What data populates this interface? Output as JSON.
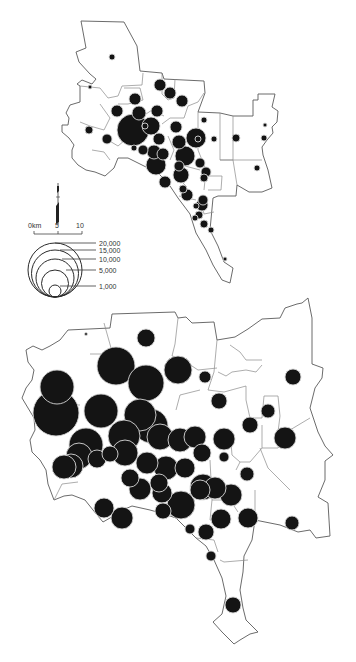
{
  "scale_bar": {
    "labels": [
      "0km",
      "5",
      "10"
    ]
  },
  "legend": {
    "title": "",
    "entries": [
      {
        "label": "20,000",
        "value": 20000
      },
      {
        "label": "15,000",
        "value": 15000
      },
      {
        "label": "10,000",
        "value": 10000
      },
      {
        "label": "5,000",
        "value": 5000
      },
      {
        "label": "1,000",
        "value": 1000
      }
    ]
  },
  "north_arrow": {
    "symbol": "north-arrow"
  },
  "maps": [
    {
      "id": "upper-map",
      "symbols": [
        {
          "x": 112,
          "y": 57,
          "r": 3
        },
        {
          "x": 90,
          "y": 87,
          "r": 2
        },
        {
          "x": 160,
          "y": 85,
          "r": 6
        },
        {
          "x": 135,
          "y": 99,
          "r": 6
        },
        {
          "x": 182,
          "y": 101,
          "r": 6
        },
        {
          "x": 117,
          "y": 111,
          "r": 6
        },
        {
          "x": 139,
          "y": 113,
          "r": 7
        },
        {
          "x": 157,
          "y": 111,
          "r": 6
        },
        {
          "x": 89,
          "y": 130,
          "r": 4
        },
        {
          "x": 107,
          "y": 139,
          "r": 5
        },
        {
          "x": 133,
          "y": 130,
          "r": 16
        },
        {
          "x": 151,
          "y": 126,
          "r": 9
        },
        {
          "x": 176,
          "y": 127,
          "r": 6
        },
        {
          "x": 196,
          "y": 138,
          "r": 10
        },
        {
          "x": 159,
          "y": 139,
          "r": 6
        },
        {
          "x": 179,
          "y": 142,
          "r": 7
        },
        {
          "x": 214,
          "y": 139,
          "r": 3
        },
        {
          "x": 134,
          "y": 148,
          "r": 3
        },
        {
          "x": 143,
          "y": 150,
          "r": 5
        },
        {
          "x": 154,
          "y": 152,
          "r": 7
        },
        {
          "x": 163,
          "y": 154,
          "r": 6
        },
        {
          "x": 156,
          "y": 165,
          "r": 10
        },
        {
          "x": 185,
          "y": 156,
          "r": 10
        },
        {
          "x": 198,
          "y": 139,
          "r": 3
        },
        {
          "x": 236,
          "y": 138,
          "r": 4
        },
        {
          "x": 264,
          "y": 138,
          "r": 3
        },
        {
          "x": 257,
          "y": 168,
          "r": 3
        },
        {
          "x": 179,
          "y": 166,
          "r": 5
        },
        {
          "x": 165,
          "y": 182,
          "r": 6
        },
        {
          "x": 181,
          "y": 175,
          "r": 8
        },
        {
          "x": 204,
          "y": 120,
          "r": 3
        },
        {
          "x": 187,
          "y": 195,
          "r": 6
        },
        {
          "x": 202,
          "y": 205,
          "r": 6
        },
        {
          "x": 204,
          "y": 224,
          "r": 4
        },
        {
          "x": 145,
          "y": 126,
          "r": 3
        },
        {
          "x": 170,
          "y": 93,
          "r": 6
        },
        {
          "x": 196,
          "y": 206,
          "r": 3
        },
        {
          "x": 206,
          "y": 172,
          "r": 5
        },
        {
          "x": 199,
          "y": 215,
          "r": 4
        },
        {
          "x": 211,
          "y": 230,
          "r": 3
        },
        {
          "x": 225,
          "y": 259,
          "r": 2
        },
        {
          "x": 265,
          "y": 125,
          "r": 2
        },
        {
          "x": 200,
          "y": 163,
          "r": 5
        },
        {
          "x": 195,
          "y": 218,
          "r": 3
        },
        {
          "x": 204,
          "y": 178,
          "r": 4
        },
        {
          "x": 203,
          "y": 200,
          "r": 5
        },
        {
          "x": 183,
          "y": 189,
          "r": 4
        }
      ]
    },
    {
      "id": "lower-map",
      "symbols": [
        {
          "x": 86,
          "y": 334,
          "r": 1.5
        },
        {
          "x": 146,
          "y": 338,
          "r": 9
        },
        {
          "x": 116,
          "y": 366,
          "r": 19
        },
        {
          "x": 146,
          "y": 383,
          "r": 18
        },
        {
          "x": 178,
          "y": 370,
          "r": 14
        },
        {
          "x": 57,
          "y": 387,
          "r": 17
        },
        {
          "x": 56,
          "y": 413,
          "r": 23
        },
        {
          "x": 101,
          "y": 411,
          "r": 17
        },
        {
          "x": 140,
          "y": 415,
          "r": 16
        },
        {
          "x": 86,
          "y": 445,
          "r": 17
        },
        {
          "x": 124,
          "y": 436,
          "r": 16
        },
        {
          "x": 151,
          "y": 426,
          "r": 17
        },
        {
          "x": 160,
          "y": 437,
          "r": 13
        },
        {
          "x": 180,
          "y": 440,
          "r": 12
        },
        {
          "x": 205,
          "y": 377,
          "r": 6
        },
        {
          "x": 219,
          "y": 401,
          "r": 8
        },
        {
          "x": 268,
          "y": 411,
          "r": 7
        },
        {
          "x": 250,
          "y": 425,
          "r": 8
        },
        {
          "x": 293,
          "y": 377,
          "r": 8
        },
        {
          "x": 195,
          "y": 437,
          "r": 11
        },
        {
          "x": 224,
          "y": 439,
          "r": 11
        },
        {
          "x": 231,
          "y": 495,
          "r": 11
        },
        {
          "x": 285,
          "y": 438,
          "r": 11
        },
        {
          "x": 202,
          "y": 453,
          "r": 9
        },
        {
          "x": 79,
          "y": 456,
          "r": 13
        },
        {
          "x": 97,
          "y": 459,
          "r": 9
        },
        {
          "x": 71,
          "y": 466,
          "r": 12
        },
        {
          "x": 110,
          "y": 454,
          "r": 8
        },
        {
          "x": 125,
          "y": 453,
          "r": 13
        },
        {
          "x": 147,
          "y": 463,
          "r": 11
        },
        {
          "x": 166,
          "y": 468,
          "r": 12
        },
        {
          "x": 185,
          "y": 468,
          "r": 10
        },
        {
          "x": 159,
          "y": 483,
          "r": 9
        },
        {
          "x": 130,
          "y": 478,
          "r": 9
        },
        {
          "x": 64,
          "y": 467,
          "r": 12
        },
        {
          "x": 203,
          "y": 487,
          "r": 13
        },
        {
          "x": 181,
          "y": 505,
          "r": 14
        },
        {
          "x": 162,
          "y": 493,
          "r": 10
        },
        {
          "x": 200,
          "y": 490,
          "r": 10
        },
        {
          "x": 140,
          "y": 489,
          "r": 11
        },
        {
          "x": 247,
          "y": 474,
          "r": 7
        },
        {
          "x": 215,
          "y": 488,
          "r": 11
        },
        {
          "x": 224,
          "y": 457,
          "r": 5
        },
        {
          "x": 163,
          "y": 511,
          "r": 8
        },
        {
          "x": 190,
          "y": 529,
          "r": 5
        },
        {
          "x": 221,
          "y": 519,
          "r": 10
        },
        {
          "x": 248,
          "y": 518,
          "r": 10
        },
        {
          "x": 292,
          "y": 523,
          "r": 7
        },
        {
          "x": 206,
          "y": 532,
          "r": 8
        },
        {
          "x": 211,
          "y": 556,
          "r": 5
        },
        {
          "x": 233,
          "y": 605,
          "r": 8
        },
        {
          "x": 122,
          "y": 518,
          "r": 11
        },
        {
          "x": 104,
          "y": 508,
          "r": 10
        }
      ]
    }
  ]
}
